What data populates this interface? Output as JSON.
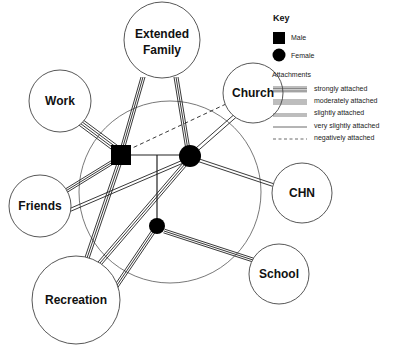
{
  "diagram": {
    "type": "ecomap",
    "nodes": {
      "extended_family": {
        "label_line1": "Extended",
        "label_line2": "Family"
      },
      "work": {
        "label": "Work"
      },
      "church": {
        "label": "Church"
      },
      "friends": {
        "label": "Friends"
      },
      "chn": {
        "label": "CHN"
      },
      "recreation": {
        "label": "Recreation"
      },
      "school": {
        "label": "School"
      }
    },
    "family_members": [
      {
        "id": "male",
        "shape": "square"
      },
      {
        "id": "female",
        "shape": "circle"
      },
      {
        "id": "child",
        "shape": "circle"
      }
    ],
    "connections": [
      {
        "from": "male",
        "to": "work",
        "type": "strongly attached"
      },
      {
        "from": "male",
        "to": "extended_family",
        "type": "moderately attached"
      },
      {
        "from": "female",
        "to": "extended_family",
        "type": "moderately attached"
      },
      {
        "from": "male",
        "to": "church",
        "type": "negatively attached"
      },
      {
        "from": "female",
        "to": "church",
        "type": "slightly attached"
      },
      {
        "from": "male",
        "to": "friends",
        "type": "moderately attached"
      },
      {
        "from": "female",
        "to": "friends",
        "type": "slightly attached"
      },
      {
        "from": "female",
        "to": "chn",
        "type": "slightly attached"
      },
      {
        "from": "male",
        "to": "recreation",
        "type": "moderately attached"
      },
      {
        "from": "female",
        "to": "recreation",
        "type": "moderately attached"
      },
      {
        "from": "child",
        "to": "recreation",
        "type": "moderately attached"
      },
      {
        "from": "child",
        "to": "school",
        "type": "moderately attached"
      }
    ]
  },
  "key": {
    "title": "Key",
    "male_label": "Male",
    "female_label": "Female",
    "attachments_title": "Attachments",
    "attachments": [
      {
        "label": "strongly attached"
      },
      {
        "label": "moderately attached"
      },
      {
        "label": "slightly attached"
      },
      {
        "label": "very slightly attached"
      },
      {
        "label": "negatively attached"
      }
    ]
  }
}
